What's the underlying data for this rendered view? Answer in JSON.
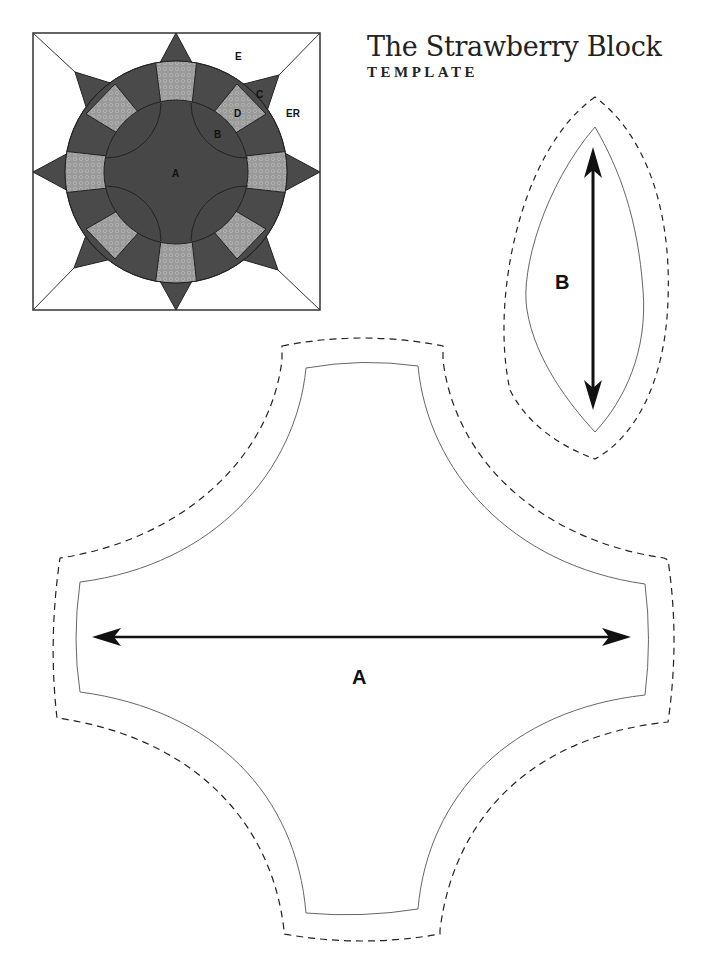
{
  "header": {
    "title": "The Strawberry Block",
    "subtitle": "TEMPLATE"
  },
  "block_diagram": {
    "labels": {
      "A": "A",
      "B": "B",
      "C": "C",
      "D": "D",
      "E": "E",
      "ER": "ER"
    },
    "colors": {
      "dark": "#4a4a4a",
      "light": "#9a9a9a",
      "background": "#ffffff",
      "outline": "#222222"
    }
  },
  "templates": {
    "B": {
      "label": "B",
      "grain_arrow": "vertical"
    },
    "A": {
      "label": "A",
      "grain_arrow": "horizontal"
    }
  }
}
